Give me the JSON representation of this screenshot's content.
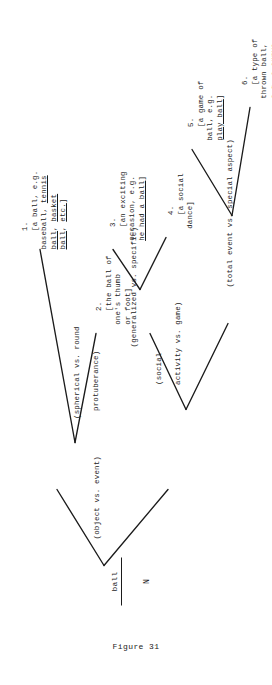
{
  "figure": {
    "caption": "Figure 31",
    "root": {
      "word": "ball",
      "pos": "N"
    },
    "branch_labels": [
      {
        "id": "object-vs-event",
        "text": "(object vs. event)"
      },
      {
        "id": "spherical-vs-round-protuberance",
        "line1": "(spherical vs. round",
        "line2": "protuberance)"
      },
      {
        "id": "social-activity-vs-game",
        "line1": "(social",
        "line2": "activity vs. game)"
      },
      {
        "id": "generalized-vs-specific",
        "text": "(generalized vs. specific)"
      },
      {
        "id": "total-event-vs-special-aspect",
        "text": "(total event vs. special aspect)"
      }
    ],
    "leaves": [
      {
        "id": "sense-1",
        "number": "1.",
        "lines": [
          "[a ball, e.g.",
          "baseball, tennis",
          "ball, basket",
          "ball, etc.]"
        ],
        "underlined": [
          "tennis",
          "ball,",
          "basket",
          "ball,",
          "etc."
        ]
      },
      {
        "id": "sense-2",
        "number": "2.",
        "lines": [
          "[the ball of",
          "one's thumb",
          "or foot]"
        ],
        "underlined": []
      },
      {
        "id": "sense-3",
        "number": "3.",
        "lines": [
          "[an exciting",
          "occasion, e.g.",
          "he had a ball]"
        ],
        "underlined": [
          "he had a ball"
        ]
      },
      {
        "id": "sense-4",
        "number": "4.",
        "lines": [
          "[a social",
          "dance]"
        ],
        "underlined": []
      },
      {
        "id": "sense-5",
        "number": "5.",
        "lines": [
          "[a game of",
          "ball, e.g.",
          "play ball]"
        ],
        "underlined": [
          "play ball"
        ]
      },
      {
        "id": "sense-6",
        "number": "6.",
        "lines": [
          "[a type of",
          "thrown ball,",
          "e.g. a curve",
          "ball, a ball",
          "vs. a strike]"
        ],
        "underlined": [
          "a curve",
          "ball,",
          "a ball",
          "vs.",
          "a strike"
        ]
      }
    ],
    "colors": {
      "ink": "#1b1b1b",
      "paper": "#ffffff"
    }
  }
}
